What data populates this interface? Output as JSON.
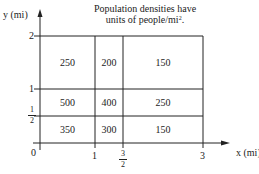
{
  "title": {
    "line1": "Population densities have",
    "line2": "units of people/mi",
    "exp": "2",
    "period": "."
  },
  "axes": {
    "y_label": "y (mi)",
    "x_label": "x (mi)",
    "y_ticks": [
      {
        "label": "2"
      },
      {
        "label": "1"
      },
      {
        "num": "1",
        "den": "2"
      },
      {
        "label": "0"
      }
    ],
    "x_ticks": [
      {
        "label": "1"
      },
      {
        "num": "3",
        "den": "2"
      },
      {
        "label": "3"
      }
    ]
  },
  "grid": {
    "rows": [
      {
        "y_range": "1–2",
        "cells": [
          "250",
          "200",
          "150"
        ]
      },
      {
        "y_range": "1/2–1",
        "cells": [
          "500",
          "400",
          "250"
        ]
      },
      {
        "y_range": "0–1/2",
        "cells": [
          "350",
          "300",
          "150"
        ]
      }
    ],
    "columns": [
      "0–1",
      "1–3/2",
      "3/2–3"
    ]
  }
}
